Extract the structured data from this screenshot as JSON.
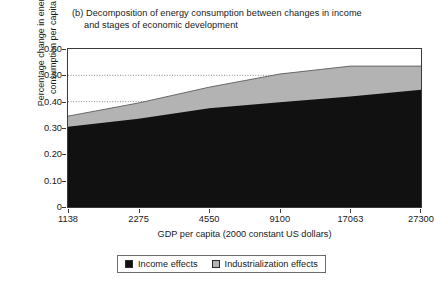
{
  "chart_data": {
    "type": "area",
    "title_prefix": "(b)",
    "title_line1": "(b) Decomposition of energy consumption between changes in income",
    "title_line2": "and stages of economic development",
    "title": "(b) Decomposition of energy consumption between changes in income and stages of economic development",
    "xlabel": "GDP per capita (2000 constant US dollars)",
    "ylabel": "Percentage change in energy consumption per capita",
    "categories": [
      "1138",
      "2275",
      "4550",
      "9100",
      "17063",
      "27300"
    ],
    "x_tick_labels": [
      "1138",
      "2275",
      "4550",
      "9100",
      "17063",
      "27300"
    ],
    "y_tick_labels": [
      "0",
      "0.10",
      "0.20",
      "0.30",
      "0.40",
      "0.50",
      "0.60"
    ],
    "y_tick_values": [
      0,
      0.1,
      0.2,
      0.3,
      0.4,
      0.5,
      0.6
    ],
    "ylim": [
      0,
      0.6
    ],
    "stacked": true,
    "grid": "horizontal-dotted at 0.40 and 0.50",
    "gridlines": [
      0.4,
      0.5
    ],
    "legend_position": "bottom-center",
    "series": [
      {
        "name": "Income effects",
        "color": "#111111",
        "values": [
          0.305,
          0.335,
          0.375,
          0.398,
          0.42,
          0.445
        ]
      },
      {
        "name": "Industrialization effects",
        "color": "#b3b3b3",
        "values": [
          0.04,
          0.06,
          0.08,
          0.107,
          0.115,
          0.09
        ]
      }
    ],
    "cumulative_top": [
      0.345,
      0.395,
      0.455,
      0.505,
      0.535,
      0.535
    ]
  },
  "legend": {
    "items": [
      {
        "label": "Income effects",
        "color": "#111111"
      },
      {
        "label": "Industrialization effects",
        "color": "#b3b3b3"
      }
    ]
  },
  "colors": {
    "income": "#111111",
    "industrialization": "#b3b3b3",
    "axis": "#3a3a3a",
    "grid": "#8c8c8c",
    "text": "#1a1a1a"
  }
}
